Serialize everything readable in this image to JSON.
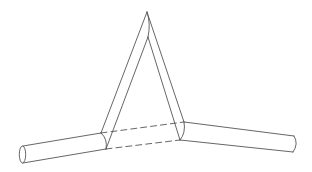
{
  "diagram": {
    "stroke_color": "#555555",
    "stroke_width": 0.9,
    "background": "#ffffff",
    "parts": {
      "left_segment": {
        "end_ellipse": {
          "cx": 22.5,
          "cy": 154.5,
          "rx": 3.2,
          "ry": 8.5
        },
        "top_line": [
          [
            23,
            146
          ],
          [
            101,
            133
          ]
        ],
        "bottom_line": [
          [
            23,
            163
          ],
          [
            106,
            149
          ]
        ]
      },
      "left_joint_curve": "M101,133 Q108,139 106,149",
      "left_arm": {
        "outer_line": [
          [
            101,
            133
          ],
          [
            147,
            12
          ]
        ],
        "inner_line": [
          [
            106,
            149
          ],
          [
            148,
            37
          ]
        ]
      },
      "apex_curve": "M147,12 Q151,24 148,37",
      "right_arm": {
        "outer_line": [
          [
            147,
            12
          ],
          [
            184,
            122
          ]
        ],
        "inner_line": [
          [
            148,
            37
          ],
          [
            180,
            140
          ]
        ]
      },
      "right_joint_curve": "M184,122 Q186,133 180,140",
      "hidden_segment": {
        "upper_dashed": [
          [
            101,
            133
          ],
          [
            184,
            122
          ]
        ],
        "lower_dashed": [
          [
            106,
            149
          ],
          [
            180,
            140
          ]
        ]
      },
      "right_segment": {
        "top_line": [
          [
            184,
            122
          ],
          [
            294,
            136
          ]
        ],
        "bottom_line": [
          [
            180,
            140
          ],
          [
            293,
            152
          ]
        ],
        "end_curve": "M294,136 Q299,144 293,152"
      }
    }
  }
}
